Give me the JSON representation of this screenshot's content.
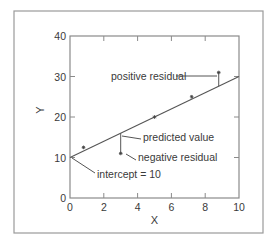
{
  "chart_data": {
    "type": "scatter",
    "title": "",
    "xlabel": "X",
    "ylabel": "Y",
    "xlim": [
      0,
      10
    ],
    "ylim": [
      0,
      40
    ],
    "x_ticks": [
      0,
      2,
      4,
      6,
      8,
      10
    ],
    "y_ticks": [
      0,
      10,
      20,
      30,
      40
    ],
    "x_tick_labels": [
      "0",
      "2",
      "4",
      "6",
      "8",
      "10"
    ],
    "y_tick_labels": [
      "0",
      "10",
      "20",
      "30",
      "40"
    ],
    "grid": false,
    "legend": null,
    "series": [
      {
        "name": "observations",
        "marker": "*",
        "points": [
          {
            "x": 0.8,
            "y": 12.5
          },
          {
            "x": 3.0,
            "y": 11.0
          },
          {
            "x": 5.0,
            "y": 20.0
          },
          {
            "x": 7.2,
            "y": 25.0
          },
          {
            "x": 8.8,
            "y": 31.0
          }
        ]
      },
      {
        "name": "regression line",
        "type": "line",
        "intercept": 10,
        "slope": 2,
        "points": [
          {
            "x": 0,
            "y": 10
          },
          {
            "x": 10,
            "y": 30
          }
        ]
      }
    ],
    "residual_segments": [
      {
        "x": 8.8,
        "y_obs": 31.0,
        "y_pred": 27.6,
        "kind": "positive"
      },
      {
        "x": 3.0,
        "y_obs": 11.0,
        "y_pred": 16.0,
        "kind": "negative"
      }
    ],
    "annotations": [
      {
        "text": "positive residual",
        "target": {
          "x": 8.8,
          "y": 30.5
        }
      },
      {
        "text": "predicted value",
        "target": {
          "x": 3.0,
          "y": 16.0
        }
      },
      {
        "text": "negative residual",
        "target": {
          "x": 3.0,
          "y": 11.0
        }
      },
      {
        "text": "intercept = 10",
        "target": {
          "x": 0,
          "y": 10
        }
      }
    ]
  },
  "colors": {
    "axis": "#8a8a8a",
    "frame": "#9a9a9a",
    "line": "#555555",
    "text": "#3a3a3a",
    "marker": "#444444"
  }
}
